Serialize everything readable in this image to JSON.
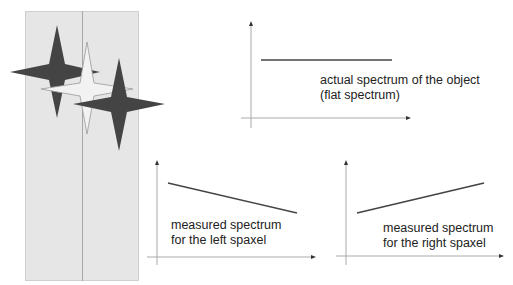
{
  "figure": {
    "panel": {
      "description": "slit / spaxel panel with two spaxels"
    },
    "stars": [
      {
        "name": "left-star",
        "fill": "#444444"
      },
      {
        "name": "center-star",
        "fill": "#f2f2f2"
      },
      {
        "name": "right-star",
        "fill": "#444444"
      }
    ]
  },
  "plots": {
    "top": {
      "label_line1": "actual spectrum of the object",
      "label_line2": "(flat spectrum)"
    },
    "bottom_left": {
      "label_line1": "measured spectrum",
      "label_line2": "for the left spaxel"
    },
    "bottom_right": {
      "label_line1": "measured spectrum",
      "label_line2": "for the right spaxel"
    }
  },
  "colors": {
    "axis": "#999999",
    "line": "#444444",
    "panel": "#e6e6e6",
    "star_dark": "#444444"
  }
}
